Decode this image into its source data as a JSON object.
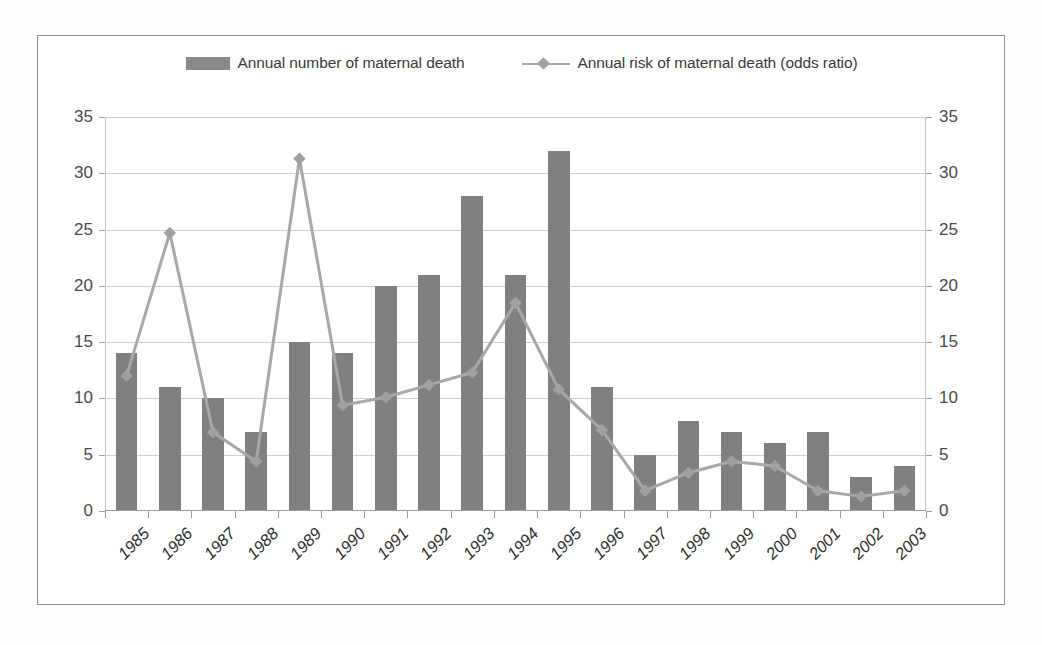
{
  "chart_data": {
    "type": "bar",
    "title": "",
    "subtitle": "",
    "xlabel": "",
    "ylabel": "",
    "y2label": "",
    "ylim": [
      0,
      35
    ],
    "y2lim": [
      0,
      35
    ],
    "yticks": [
      0,
      5,
      10,
      15,
      20,
      25,
      30,
      35
    ],
    "y2ticks": [
      0,
      5,
      10,
      15,
      20,
      25,
      30,
      35
    ],
    "grid": true,
    "legend_position": "top-center",
    "categories": [
      "1985",
      "1986",
      "1987",
      "1988",
      "1989",
      "1990",
      "1991",
      "1992",
      "1993",
      "1994",
      "1995",
      "1996",
      "1997",
      "1998",
      "1999",
      "2000",
      "2001",
      "2002",
      "2003"
    ],
    "series": [
      {
        "name": "Annual number of maternal death",
        "type": "bar",
        "axis": "left",
        "color": "#808080",
        "values": [
          14,
          11,
          10,
          7,
          15,
          14,
          20,
          21,
          28,
          21,
          32,
          11,
          5,
          8,
          7,
          6,
          7,
          3,
          4
        ]
      },
      {
        "name": "Annual risk of maternal death (odds ratio)",
        "type": "line",
        "axis": "right",
        "color": "#a8a8a8",
        "marker": "diamond",
        "values": [
          12.0,
          24.7,
          7.0,
          4.4,
          31.3,
          9.4,
          10.1,
          11.2,
          12.3,
          18.5,
          10.8,
          7.2,
          1.8,
          3.4,
          4.4,
          4.0,
          1.8,
          1.3,
          1.8
        ]
      }
    ]
  },
  "legend": {
    "entries": [
      {
        "label": "Annual number of maternal death",
        "marker": "bar-swatch"
      },
      {
        "label": "Annual risk of maternal death (odds ratio)",
        "marker": "line-diamond-swatch"
      }
    ]
  },
  "colors": {
    "bar": "#808080",
    "line": "#a8a8a8",
    "marker": "#a0a0a0",
    "grid": "#cfcfcf",
    "frame": "#8d8d8d",
    "axis_text": "#4a4a4a",
    "background": "#ffffff"
  }
}
